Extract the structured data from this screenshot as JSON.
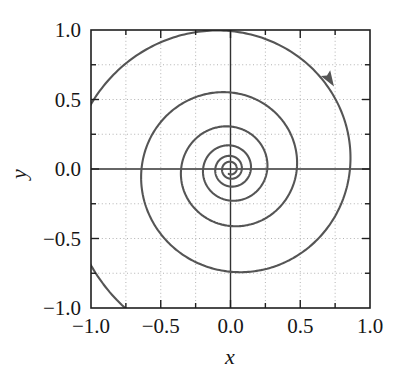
{
  "chart_data": {
    "type": "line",
    "title": "",
    "subtitle": "",
    "xlabel": "x",
    "ylabel": "y",
    "xlim": [
      -1.0,
      1.0
    ],
    "ylim": [
      -1.0,
      1.0
    ],
    "xticks": [
      -1.0,
      -0.5,
      0.0,
      0.5,
      1.0
    ],
    "yticks": [
      -1.0,
      -0.5,
      0.0,
      0.5,
      1.0
    ],
    "xtick_labels": [
      "-1.0",
      "-0.5",
      "0.0",
      "0.5",
      "1.0"
    ],
    "ytick_labels": [
      "1.0",
      "0.5",
      "0.0",
      "-0.5",
      "-1.0"
    ],
    "minor_tick_step": 0.25,
    "grid": true,
    "grid_style": "dotted",
    "grid_step": 0.25,
    "legend": null,
    "legend_position": "none",
    "series": [
      {
        "name": "inward-spiral-trajectory",
        "type": "parametric_spiral",
        "direction": "clockwise-inward",
        "r0": 1.45,
        "decay_per_turn": 0.555,
        "theta_start_deg": 38,
        "turns": 6.2,
        "color": "#555555",
        "line_width": 2.1
      }
    ],
    "annotations": [
      {
        "name": "direction-arrow",
        "kind": "arrowhead",
        "x": 0.7,
        "y": 0.66,
        "rotation_deg": 58,
        "meaning": "clockwise flow direction"
      }
    ],
    "axis_lines": {
      "x_zero": 0.0,
      "y_zero": 0.0,
      "color": "#333333"
    }
  },
  "axes": {
    "x_label": "x",
    "y_label": "y",
    "x_tick_labels": [
      "-1.0",
      "-0.5",
      "0.0",
      "0.5",
      "1.0"
    ],
    "y_tick_labels": [
      "1.0",
      "0.5",
      "0.0",
      "-0.5",
      "-1.0"
    ]
  },
  "colors": {
    "background": "#ffffff",
    "frame": "#1f1f1f",
    "curve": "#555555",
    "grid": "#aaaaaa",
    "axis_line": "#333333",
    "text": "#161616"
  }
}
